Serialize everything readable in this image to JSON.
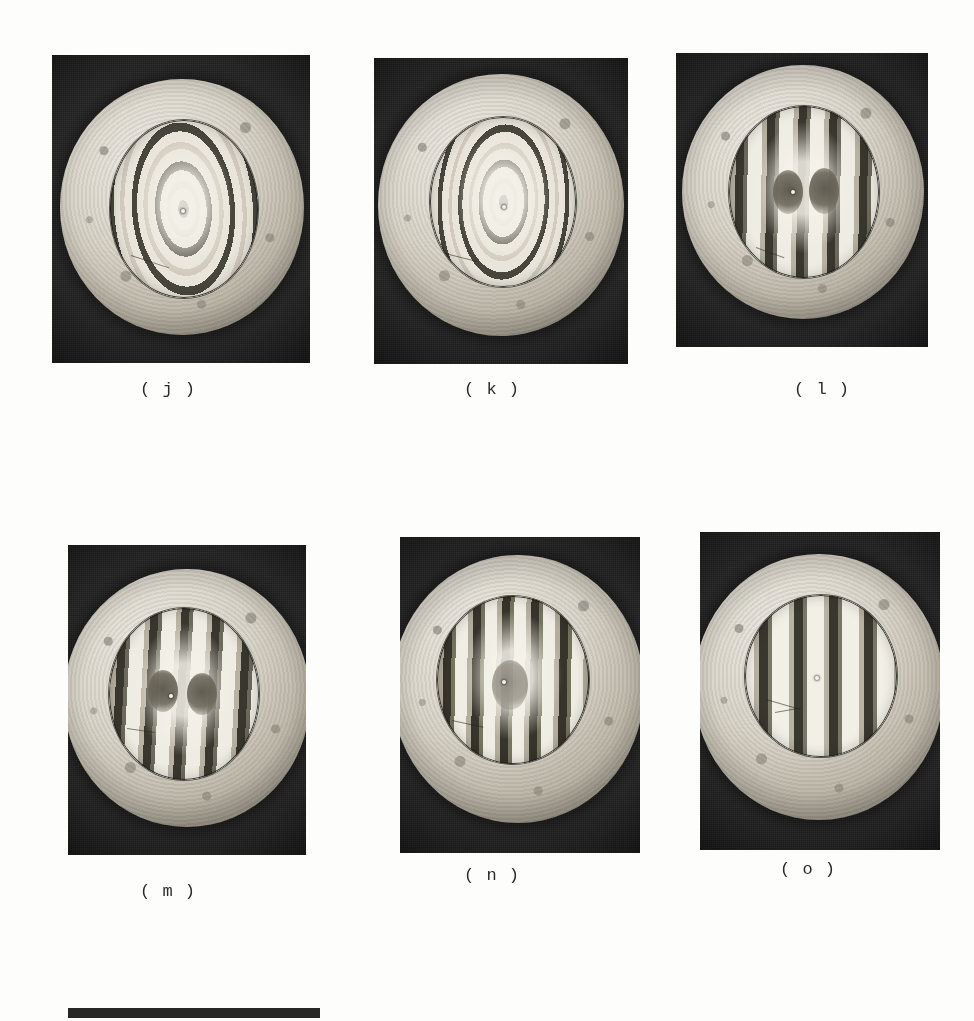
{
  "figure": {
    "kind": "photoelastic-interferogram-plate",
    "background_color": "#fdfdfc",
    "ink_color": "#2b2b2b",
    "panel_background_color": "#2a2a2a",
    "disc_light_color": "#e9e5da",
    "disc_dark_color": "#6d6a60"
  },
  "panels": [
    {
      "id": "j",
      "caption": "( j )",
      "row": 1,
      "column": 1,
      "fringe_pattern": "looped",
      "fringe_count": 6,
      "caption_x": 168,
      "caption_y": 388
    },
    {
      "id": "k",
      "caption": "( k )",
      "row": 1,
      "column": 2,
      "fringe_pattern": "looped",
      "fringe_count": 8,
      "caption_x": 492,
      "caption_y": 388
    },
    {
      "id": "l",
      "caption": "( l )",
      "row": 1,
      "column": 3,
      "fringe_pattern": "vertical",
      "fringe_count": 9,
      "caption_x": 822,
      "caption_y": 388
    },
    {
      "id": "m",
      "caption": "( m )",
      "row": 2,
      "column": 1,
      "fringe_pattern": "vertical",
      "fringe_count": 9,
      "caption_x": 168,
      "caption_y": 890
    },
    {
      "id": "n",
      "caption": "( n )",
      "row": 2,
      "column": 2,
      "fringe_pattern": "vertical",
      "fringe_count": 10,
      "caption_x": 492,
      "caption_y": 874
    },
    {
      "id": "o",
      "caption": "( o )",
      "row": 2,
      "column": 3,
      "fringe_pattern": "vertical-dense",
      "fringe_count": 11,
      "caption_x": 808,
      "caption_y": 868
    }
  ],
  "scale_bar": {
    "label": "",
    "x": 68,
    "y": 1008,
    "width": 252,
    "height": 10,
    "color": "#272727"
  }
}
